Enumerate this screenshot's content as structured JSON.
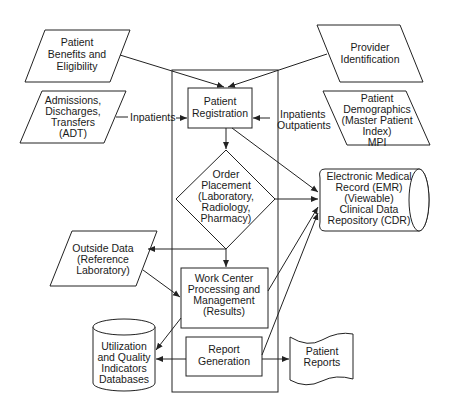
{
  "diagram": {
    "nodes": {
      "benefits": {
        "lines": [
          "Patient",
          "Benefits and",
          "Eligibility"
        ],
        "shape": "parallelogram"
      },
      "adt": {
        "lines": [
          "Admissions,",
          "Discharges,",
          "Transfers",
          "(ADT)"
        ],
        "shape": "parallelogram"
      },
      "provider": {
        "lines": [
          "Provider",
          "Identification"
        ],
        "shape": "parallelogram"
      },
      "demographics": {
        "lines": [
          "Patient",
          "Demographics",
          "(Master Patient",
          "Index)",
          "MPI"
        ],
        "shape": "parallelogram"
      },
      "registration": {
        "lines": [
          "Patient",
          "Registration"
        ],
        "shape": "rectangle"
      },
      "order": {
        "lines": [
          "Order",
          "Placement",
          "(Laboratory,",
          "Radiology,",
          "Pharmacy)"
        ],
        "shape": "diamond"
      },
      "emr": {
        "lines": [
          "Electronic Medical",
          "Record (EMR)",
          "(Viewable)",
          "Clinical Data",
          "Repository (CDR)"
        ],
        "shape": "cylinder-horizontal"
      },
      "outside": {
        "lines": [
          "Outside Data",
          "(Reference",
          "Laboratory)"
        ],
        "shape": "parallelogram"
      },
      "workcenter": {
        "lines": [
          "Work Center",
          "Processing and",
          "Management",
          "(Results)"
        ],
        "shape": "rectangle"
      },
      "report": {
        "lines": [
          "Report",
          "Generation"
        ],
        "shape": "rectangle"
      },
      "utilization": {
        "lines": [
          "Utilization",
          "and Quality",
          "Indicators",
          "Databases"
        ],
        "shape": "cylinder-vertical"
      },
      "patient_reports": {
        "lines": [
          "Patient",
          "Reports"
        ],
        "shape": "document"
      }
    },
    "edge_labels": {
      "inpatients_left": "Inpatients",
      "inpatients_right": "Inpatients",
      "outpatients_right": "Outpatients"
    },
    "edges": [
      {
        "from": "benefits",
        "to": "registration"
      },
      {
        "from": "provider",
        "to": "registration"
      },
      {
        "from": "adt",
        "to": "registration",
        "label": "Inpatients"
      },
      {
        "from": "demographics",
        "to": "registration",
        "label": "Inpatients Outpatients"
      },
      {
        "from": "registration",
        "to": "order"
      },
      {
        "from": "registration",
        "to": "emr"
      },
      {
        "from": "order",
        "to": "emr"
      },
      {
        "from": "order",
        "to": "outside"
      },
      {
        "from": "order",
        "to": "workcenter"
      },
      {
        "from": "outside",
        "to": "workcenter"
      },
      {
        "from": "workcenter",
        "to": "emr"
      },
      {
        "from": "workcenter",
        "to": "utilization"
      },
      {
        "from": "report",
        "to": "emr"
      },
      {
        "from": "report",
        "to": "utilization"
      },
      {
        "from": "report",
        "to": "patient_reports"
      }
    ]
  }
}
